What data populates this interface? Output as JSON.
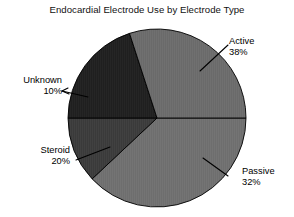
{
  "chart_data": {
    "type": "pie",
    "title": "Endocardial Electrode Use by Electrode Type",
    "xlabel": "",
    "ylabel": "",
    "grid": false,
    "legend": "none",
    "labels_position": "callouts-with-leader-lines",
    "start_angle_deg": 0,
    "direction": "clockwise",
    "categories": [
      "Active",
      "Passive",
      "Steroid",
      "Unknown"
    ],
    "values": [
      38,
      32,
      20,
      10
    ],
    "value_unit": "percent",
    "slices": [
      {
        "name": "Active",
        "value": 38,
        "value_label": "38%",
        "color": "#6e6e6e",
        "start_deg": 0,
        "end_deg": 136.8
      },
      {
        "name": "Passive",
        "value": 32,
        "value_label": "32%",
        "color": "#6a6a6a",
        "start_deg": 252.0,
        "end_deg": 360.0
      },
      {
        "name": "Steroid",
        "value": 20,
        "value_label": "20%",
        "color": "#1f1f1f",
        "start_deg": 180.0,
        "end_deg": 252.0
      },
      {
        "name": "Unknown",
        "value": 10,
        "value_label": "10%",
        "color": "#3a3a3a",
        "start_deg": 136.8,
        "end_deg": 180.0
      }
    ]
  },
  "chart": {
    "title": "Endocardial Electrode Use by Electrode Type"
  },
  "callouts": {
    "active": {
      "name": "Active",
      "value": "38%"
    },
    "passive": {
      "name": "Passive",
      "value": "32%"
    },
    "steroid": {
      "name": "Steroid",
      "value": "20%"
    },
    "unknown": {
      "name": "Unknown",
      "value": "10%"
    }
  },
  "colors": {
    "background": "#ffffff",
    "text": "#000000",
    "outline": "#000000",
    "active": "#6e6e6e",
    "passive": "#6a6a6a",
    "steroid": "#1f1f1f",
    "unknown": "#3a3a3a"
  }
}
